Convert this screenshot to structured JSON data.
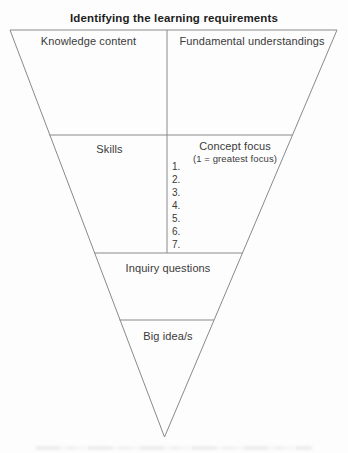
{
  "title": "Identifying the learning requirements",
  "funnel": {
    "row1": {
      "left": "Knowledge content",
      "right": "Fundamental understandings"
    },
    "row2": {
      "left": "Skills",
      "right_title": "Concept focus",
      "right_subtitle": "(1 = greatest focus)",
      "rank_list": [
        "1.",
        "2.",
        "3.",
        "4.",
        "5.",
        "6.",
        "7."
      ]
    },
    "row3": "Inquiry questions",
    "row4": "Big idea/s"
  },
  "colors": {
    "line": "#8a8a8a",
    "text": "#3a3a3a",
    "title_text": "#1d1d1d",
    "background": "#fdfdfd"
  }
}
